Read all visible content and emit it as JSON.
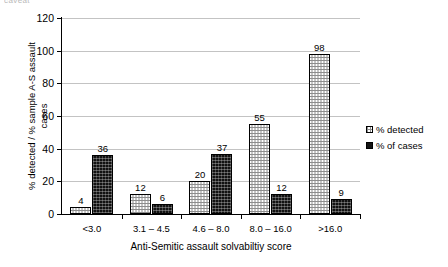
{
  "top_artifact_text": "caveat",
  "chart_data": {
    "type": "bar",
    "title": "",
    "xlabel": "Anti-Semitic assault solvabiltiy score",
    "ylabel": "% detected / % sample A-S assault\ncases",
    "categories": [
      "<3.0",
      "3.1 – 4.5",
      "4.6 – 8.0",
      "8.0 – 16.0",
      ">16.0"
    ],
    "series": [
      {
        "name": "% detected",
        "fill": "light-dotted",
        "color": "#ffffff",
        "values": [
          4,
          12,
          20,
          55,
          98
        ]
      },
      {
        "name": "% of cases",
        "fill": "dark-solid",
        "color": "#141414",
        "values": [
          36,
          6,
          37,
          12,
          9
        ]
      }
    ],
    "ylim": [
      0,
      120
    ],
    "yticks": [
      0,
      20,
      40,
      60,
      80,
      100,
      120
    ],
    "grid": "horizontal",
    "legend_position": "right-middle",
    "data_labels": true
  }
}
